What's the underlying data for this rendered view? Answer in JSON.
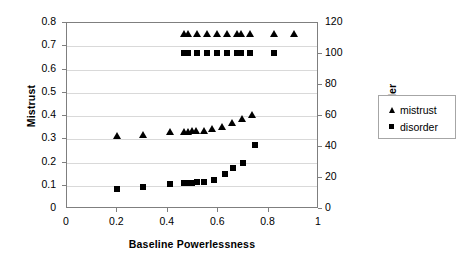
{
  "chart_data": {
    "type": "scatter",
    "title": "",
    "xlabel": "Baseline Powerlessness",
    "ylabel": "Mistrust",
    "ylabel_right": "Disorder",
    "xlim": [
      0,
      1
    ],
    "ylim": [
      0,
      0.8
    ],
    "ylim_right": [
      0,
      120
    ],
    "xticks": [
      "0",
      "0.2",
      "0.4",
      "0.6",
      "0.8",
      "1"
    ],
    "xtick_values": [
      0,
      0.2,
      0.4,
      0.6,
      0.8,
      1
    ],
    "yticks": [
      "0",
      "0.1",
      "0.2",
      "0.3",
      "0.4",
      "0.5",
      "0.6",
      "0.7",
      "0.8"
    ],
    "ytick_values": [
      0,
      0.1,
      0.2,
      0.3,
      0.4,
      0.5,
      0.6,
      0.7,
      0.8
    ],
    "yticks_right": [
      "0",
      "20",
      "40",
      "60",
      "80",
      "100",
      "120"
    ],
    "ytick_values_right": [
      0,
      20,
      40,
      60,
      80,
      100,
      120
    ],
    "grid": "horizontal",
    "legend_position": "right",
    "legend": [
      "mistrust",
      "disorder"
    ],
    "series": [
      {
        "name": "mistrust",
        "marker": "triangle",
        "axis": "left",
        "color": "#000000",
        "points": [
          [
            0.2,
            0.315
          ],
          [
            0.3,
            0.32
          ],
          [
            0.41,
            0.33
          ],
          [
            0.465,
            0.332
          ],
          [
            0.48,
            0.333
          ],
          [
            0.495,
            0.335
          ],
          [
            0.51,
            0.335
          ],
          [
            0.545,
            0.337
          ],
          [
            0.575,
            0.345
          ],
          [
            0.615,
            0.352
          ],
          [
            0.655,
            0.368
          ],
          [
            0.695,
            0.385
          ],
          [
            0.735,
            0.405
          ],
          [
            0.465,
            0.752
          ],
          [
            0.48,
            0.752
          ],
          [
            0.515,
            0.752
          ],
          [
            0.555,
            0.752
          ],
          [
            0.595,
            0.752
          ],
          [
            0.635,
            0.752
          ],
          [
            0.675,
            0.752
          ],
          [
            0.69,
            0.752
          ],
          [
            0.725,
            0.752
          ],
          [
            0.82,
            0.752
          ],
          [
            0.9,
            0.752
          ]
        ]
      },
      {
        "name": "disorder",
        "marker": "square",
        "axis": "right",
        "color": "#000000",
        "points": [
          [
            0.2,
            13.0
          ],
          [
            0.3,
            14.0
          ],
          [
            0.41,
            16.0
          ],
          [
            0.465,
            16.5
          ],
          [
            0.48,
            16.8
          ],
          [
            0.495,
            17.0
          ],
          [
            0.515,
            17.2
          ],
          [
            0.545,
            17.4
          ],
          [
            0.585,
            19.0
          ],
          [
            0.625,
            22.5
          ],
          [
            0.66,
            26.5
          ],
          [
            0.7,
            30.0
          ],
          [
            0.745,
            41.5
          ],
          [
            0.465,
            100.5
          ],
          [
            0.48,
            100.5
          ],
          [
            0.515,
            100.5
          ],
          [
            0.555,
            100.5
          ],
          [
            0.595,
            100.5
          ],
          [
            0.635,
            100.5
          ],
          [
            0.675,
            100.5
          ],
          [
            0.69,
            100.5
          ],
          [
            0.725,
            100.5
          ],
          [
            0.82,
            100.5
          ]
        ]
      }
    ]
  }
}
